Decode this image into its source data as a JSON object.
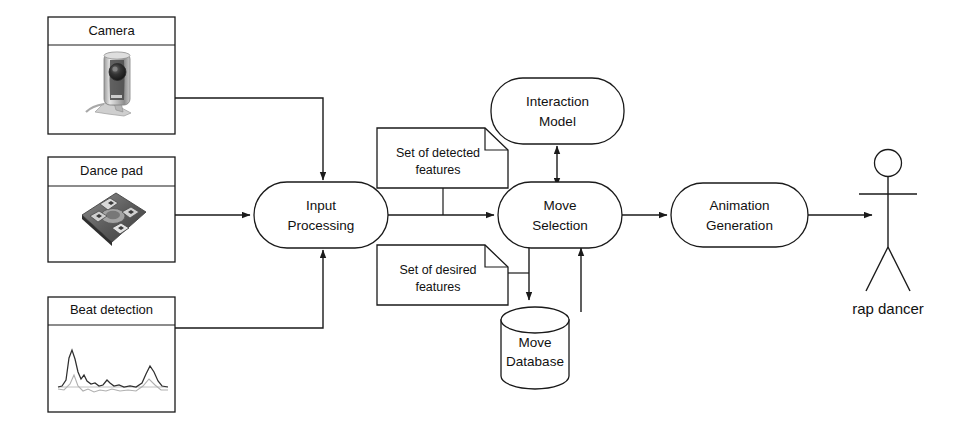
{
  "diagram": {
    "colors": {
      "stroke": "#1a1a1a",
      "background": "#ffffff",
      "text": "#111111"
    },
    "input_panels": [
      {
        "id": "camera",
        "label": "Camera",
        "image": "webcam-photo"
      },
      {
        "id": "dance-pad",
        "label": "Dance pad",
        "image": "dance-pad-photo"
      },
      {
        "id": "beat-detection",
        "label": "Beat detection",
        "image": "audio-waveform-plot"
      }
    ],
    "processes": [
      {
        "id": "input-processing",
        "line1": "Input",
        "line2": "Processing"
      },
      {
        "id": "interaction-model",
        "line1": "Interaction",
        "line2": "Model"
      },
      {
        "id": "move-selection",
        "line1": "Move",
        "line2": "Selection"
      },
      {
        "id": "animation-generation",
        "line1": "Animation",
        "line2": "Generation"
      }
    ],
    "notes": [
      {
        "id": "detected-features",
        "line1": "Set of detected",
        "line2": "features"
      },
      {
        "id": "desired-features",
        "line1": "Set of desired",
        "line2": "features"
      }
    ],
    "datastore": {
      "id": "move-database",
      "line1": "Move",
      "line2": "Database"
    },
    "actor": {
      "id": "rap-dancer",
      "label": "rap dancer"
    },
    "connections": [
      {
        "from": "camera",
        "to": "input-processing",
        "style": "arrow"
      },
      {
        "from": "dance-pad",
        "to": "input-processing",
        "style": "arrow"
      },
      {
        "from": "beat-detection",
        "to": "input-processing",
        "style": "arrow"
      },
      {
        "from": "input-processing",
        "to": "move-selection",
        "style": "arrow"
      },
      {
        "from": "move-selection",
        "to": "interaction-model",
        "style": "double-arrow"
      },
      {
        "from": "move-selection",
        "to": "move-database",
        "style": "arrow"
      },
      {
        "from": "move-database",
        "to": "move-selection",
        "style": "arrow"
      },
      {
        "from": "move-selection",
        "to": "animation-generation",
        "style": "arrow"
      },
      {
        "from": "animation-generation",
        "to": "rap-dancer",
        "style": "arrow"
      },
      {
        "from": "detected-features",
        "to": "input-processing-to-move-selection-flow",
        "style": "link"
      },
      {
        "from": "desired-features",
        "to": "move-selection-to-move-database-flow",
        "style": "link"
      }
    ]
  }
}
